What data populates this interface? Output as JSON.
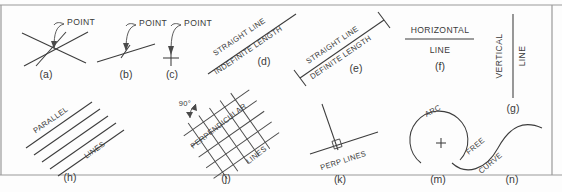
{
  "sheet": {
    "title": "Points, Lines and Curves — Technical Drawing Reference Plate",
    "background_color": "#fdfdfd",
    "ink_color": "#3c3c3c",
    "border_color": "#9a9a9a"
  },
  "figures": [
    {
      "key": "a",
      "label": "(a)",
      "annotation": "POINT",
      "description": "point located at the intersection of two crossing straight lines"
    },
    {
      "key": "b",
      "label": "(b)",
      "annotation": "POINT",
      "description": "point located by a short cross tick on a single straight line"
    },
    {
      "key": "c",
      "label": "(c)",
      "annotation": "POINT",
      "description": "point located by a small crossed plus mark"
    },
    {
      "key": "d",
      "label": "(d)",
      "annotation_line1": "STRAIGHT LINE",
      "annotation_line2": "INDEFINITE LENGTH",
      "description": "inclined straight line with no terminating ticks"
    },
    {
      "key": "e",
      "label": "(e)",
      "annotation_line1": "STRAIGHT LINE",
      "annotation_line2": "DEFINITE LENGTH",
      "description": "inclined straight line terminated by short perpendicular end ticks"
    },
    {
      "key": "f",
      "label": "(f)",
      "annotation_line1": "HORIZONTAL",
      "annotation_line2": "LINE",
      "description": "horizontal straight line"
    },
    {
      "key": "g",
      "label": "(g)",
      "annotation_line1": "VERTICAL",
      "annotation_line2": "LINE",
      "description": "vertical straight line with vertically set text"
    },
    {
      "key": "h",
      "label": "(h)",
      "annotation_line1": "PARALLEL",
      "annotation_line2": "LINES",
      "description": "five equally spaced parallel inclined lines"
    },
    {
      "key": "j",
      "label": "(j)",
      "annotation_line1": "PERPENDICULAR",
      "annotation_line2": "LINES",
      "angle_note": "90°",
      "description": "rotated crosshatch grid of mutually perpendicular lines with 90 degree callout"
    },
    {
      "key": "k",
      "label": "(k)",
      "annotation": "PERP LINES",
      "description": "two perpendicular lines with small square right angle marker"
    },
    {
      "key": "m",
      "label": "(m)",
      "annotation": "ARC",
      "description": "circular arc with plus mark indicating the centre"
    },
    {
      "key": "n",
      "label": "(n)",
      "annotation_line1": "FREE",
      "annotation_line2": "CURVE",
      "description": "irregular S shaped free curve"
    }
  ]
}
